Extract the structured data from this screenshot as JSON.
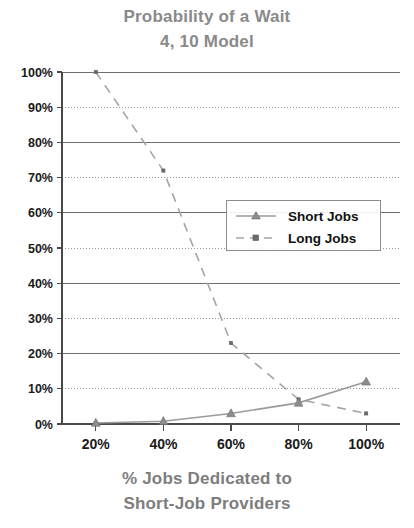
{
  "chart_data": {
    "type": "line",
    "title": "Probability of a Wait",
    "subtitle": "4, 10 Model",
    "xlabel": "% Jobs Dedicated to",
    "xlabel_line2": "Short-Job Providers",
    "ylabel": "",
    "x": [
      20,
      40,
      60,
      80,
      100
    ],
    "categories": [
      "20%",
      "40%",
      "60%",
      "80%",
      "100%"
    ],
    "xtick_labels": [
      "20%",
      "40%",
      "60%",
      "80%",
      "100%"
    ],
    "ytick_labels": [
      "0%",
      "10%",
      "20%",
      "30%",
      "40%",
      "50%",
      "60%",
      "70%",
      "80%",
      "90%",
      "100%"
    ],
    "ytick_values": [
      0,
      10,
      20,
      30,
      40,
      50,
      60,
      70,
      80,
      90,
      100
    ],
    "xlim": [
      10,
      110
    ],
    "ylim": [
      0,
      100
    ],
    "grid": true,
    "grid_axis": "y",
    "legend_position": "center-right",
    "series": [
      {
        "name": "Short Jobs",
        "values": [
          0.3,
          0.8,
          3,
          6,
          12
        ],
        "line_style": "solid",
        "marker": "triangle",
        "color": "#9b9b9b"
      },
      {
        "name": "Long Jobs",
        "values": [
          100,
          72,
          23,
          7,
          3
        ],
        "line_style": "dashed",
        "marker": "square",
        "color": "#a5a5a5"
      }
    ]
  },
  "legend": {
    "entries": [
      {
        "label": "Short Jobs"
      },
      {
        "label": "Long Jobs"
      }
    ]
  },
  "colors": {
    "title": "#8a8a8a",
    "axis_label": "#7d7d7d",
    "tick_text": "#1a1a1a",
    "grid": "#9a9a9a",
    "axis": "#4a4a4a",
    "background": "#ffffff"
  }
}
